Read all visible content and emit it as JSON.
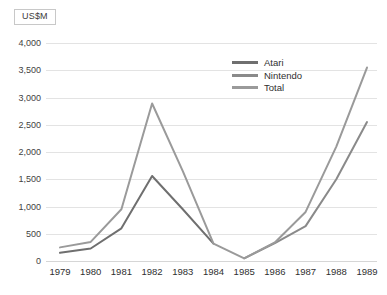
{
  "units_badge": {
    "label": "US$M"
  },
  "legend": {
    "position": "inside-top-right",
    "items": [
      {
        "name": "Atari",
        "color": "#6f6f6f"
      },
      {
        "name": "Nintendo",
        "color": "#8a8a8a"
      },
      {
        "name": "Total",
        "color": "#9a9a9a"
      }
    ]
  },
  "chart_data": {
    "type": "line",
    "title": "",
    "xlabel": "",
    "ylabel": "US$M",
    "ylim": [
      0,
      4000
    ],
    "ytick_step": 500,
    "grid": true,
    "yticks": [
      "0",
      "500",
      "1,000",
      "1,500",
      "2,000",
      "2,500",
      "3,000",
      "3,500",
      "4,000"
    ],
    "ytick_values": [
      0,
      500,
      1000,
      1500,
      2000,
      2500,
      3000,
      3500,
      4000
    ],
    "categories": [
      "1979",
      "1980",
      "1981",
      "1982",
      "1983",
      "1984",
      "1985",
      "1986",
      "1987",
      "1988",
      "1989"
    ],
    "series": [
      {
        "name": "Atari",
        "color": "#6f6f6f",
        "values": [
          150,
          230,
          600,
          1560,
          950,
          320,
          null,
          null,
          null,
          null,
          null
        ]
      },
      {
        "name": "Nintendo",
        "color": "#8a8a8a",
        "values": [
          null,
          null,
          null,
          null,
          null,
          null,
          50,
          330,
          640,
          1500,
          2550
        ]
      },
      {
        "name": "Total",
        "color": "#9a9a9a",
        "values": [
          250,
          350,
          950,
          2890,
          1650,
          320,
          50,
          340,
          900,
          2100,
          3550
        ]
      }
    ]
  }
}
